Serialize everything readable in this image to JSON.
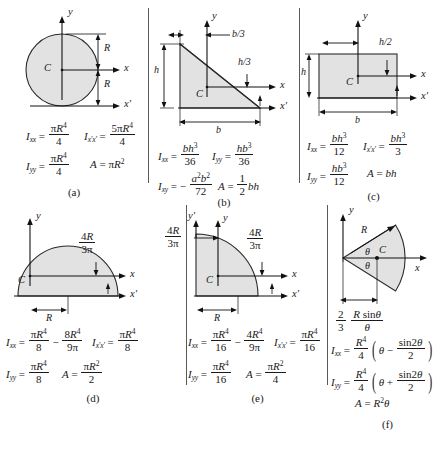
{
  "figure": {
    "panels": [
      {
        "id": "a",
        "caption": "(a)",
        "shape_name": "circle",
        "centroid_label": "C",
        "axis_labels": [
          "y",
          "x",
          "x'"
        ],
        "dimensions": [
          "R",
          "R"
        ],
        "formulas": [
          {
            "lhs": "I",
            "lhs_sub": "xx",
            "num": "πR",
            "num_sup": "4",
            "den": "4"
          },
          {
            "lhs": "I",
            "lhs_sub": "x'x'",
            "num": "5πR",
            "num_sup": "4",
            "den": "4"
          },
          {
            "lhs": "I",
            "lhs_sub": "yy",
            "num": "πR",
            "num_sup": "4",
            "den": "4"
          },
          {
            "lhs": "A",
            "lhs_sub": "",
            "plain": "πR",
            "plain_sup": "2"
          }
        ]
      },
      {
        "id": "b",
        "caption": "(b)",
        "shape_name": "right-triangle",
        "centroid_label": "C",
        "axis_labels": [
          "y",
          "x",
          "x'"
        ],
        "dimensions": [
          "b/3",
          "h/3",
          "h",
          "b"
        ],
        "formulas": [
          {
            "lhs": "I",
            "lhs_sub": "xx",
            "num": "bh",
            "num_sup": "3",
            "den": "36"
          },
          {
            "lhs": "I",
            "lhs_sub": "yy",
            "num": "hb",
            "num_sup": "3",
            "den": "36"
          },
          {
            "lhs": "I",
            "lhs_sub": "xy",
            "sign": "−",
            "num": "a²b²",
            "den": "72"
          },
          {
            "lhs": "A",
            "lhs_sub": "",
            "num": "1",
            "den": "2",
            "tail": "bh"
          }
        ]
      },
      {
        "id": "c",
        "caption": "(c)",
        "shape_name": "rectangle",
        "centroid_label": "C",
        "axis_labels": [
          "y",
          "x",
          "x'"
        ],
        "dimensions": [
          "h/2",
          "h",
          "b"
        ],
        "formulas": [
          {
            "lhs": "I",
            "lhs_sub": "xx",
            "num": "bh",
            "num_sup": "3",
            "den": "12"
          },
          {
            "lhs": "I",
            "lhs_sub": "x'x'",
            "num": "bh",
            "num_sup": "3",
            "den": "3"
          },
          {
            "lhs": "I",
            "lhs_sub": "yy",
            "num": "hb",
            "num_sup": "3",
            "den": "12"
          },
          {
            "lhs": "A",
            "lhs_sub": "",
            "plain": "bh"
          }
        ]
      },
      {
        "id": "d",
        "caption": "(d)",
        "shape_name": "semicircle",
        "centroid_label": "C",
        "axis_labels": [
          "y",
          "x",
          "x'"
        ],
        "dimensions": [
          "4R/3π",
          "R"
        ],
        "formulas": [
          {
            "lhs": "I",
            "lhs_sub": "xx",
            "num": "πR",
            "num_sup": "4",
            "den": "8",
            "op": "−",
            "num2": "8R",
            "num2_sup": "4",
            "den2": "9π"
          },
          {
            "lhs": "I",
            "lhs_sub": "x'x'",
            "num": "πR",
            "num_sup": "4",
            "den": "8"
          },
          {
            "lhs": "I",
            "lhs_sub": "yy",
            "num": "πR",
            "num_sup": "4",
            "den": "8"
          },
          {
            "lhs": "A",
            "lhs_sub": "",
            "num": "πR",
            "num_sup": "2",
            "den": "2"
          }
        ]
      },
      {
        "id": "e",
        "caption": "(e)",
        "shape_name": "quarter-circle",
        "centroid_label": "C",
        "axis_labels": [
          "y",
          "y'",
          "x",
          "x'"
        ],
        "dimensions": [
          "4R/3π",
          "4R/3π",
          "R"
        ],
        "formulas": [
          {
            "lhs": "I",
            "lhs_sub": "xx",
            "num": "πR",
            "num_sup": "4",
            "den": "16",
            "op": "−",
            "num2": "4R",
            "num2_sup": "4",
            "den2": "9π"
          },
          {
            "lhs": "I",
            "lhs_sub": "x'x'",
            "num": "πR",
            "num_sup": "4",
            "den": "16"
          },
          {
            "lhs": "I",
            "lhs_sub": "yy",
            "num": "πR",
            "num_sup": "4",
            "den": "16"
          },
          {
            "lhs": "A",
            "lhs_sub": "",
            "num": "πR",
            "num_sup": "2",
            "den": "4"
          }
        ]
      },
      {
        "id": "f",
        "caption": "(f)",
        "shape_name": "circular-sector",
        "centroid_label": "C",
        "axis_labels": [
          "y",
          "x"
        ],
        "dimensions": [
          "R",
          "θ",
          "θ",
          "2/3 R sinθ/θ"
        ],
        "formulas": [
          {
            "lhs": "I",
            "lhs_sub": "xx",
            "num": "R",
            "num_sup": "4",
            "den": "4",
            "group": "θ − sin2θ/2"
          },
          {
            "lhs": "I",
            "lhs_sub": "yy",
            "num": "R",
            "num_sup": "4",
            "den": "4",
            "group": "θ + sin2θ/2"
          },
          {
            "lhs": "A",
            "lhs_sub": "",
            "plain": "R²θ"
          }
        ]
      }
    ],
    "symbols": {
      "R": "R",
      "b": "b",
      "h": "h",
      "theta": "θ",
      "pi": "π",
      "C": "C",
      "x": "x",
      "y": "y",
      "x_prime": "x'",
      "y_prime": "y'",
      "b_over_3": "b/3",
      "h_over_3": "h/3",
      "h_over_2": "h/2",
      "four_R": "4R",
      "three_pi": "3π",
      "two": "2",
      "three": "3",
      "R_sin_theta": "R sinθ",
      "A_eq": "A ="
    },
    "captions": [
      "(a)",
      "(b)",
      "(c)",
      "(d)",
      "(e)",
      "(f)"
    ]
  }
}
